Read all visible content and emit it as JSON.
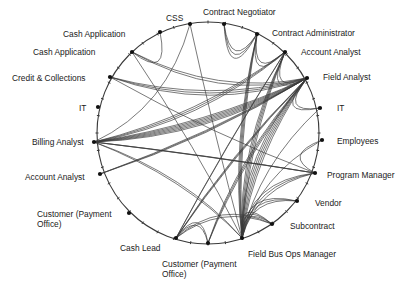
{
  "diagram": {
    "type": "chord-network",
    "colors": {
      "line": "#3a3a3a",
      "node": "#111111",
      "background": "#ffffff"
    },
    "circle": {
      "cx": 208,
      "cy": 133,
      "r": 111
    },
    "nodes": [
      {
        "id": "css",
        "label": "CSS",
        "x": 190,
        "y": 24,
        "lx": 166,
        "ly": 13
      },
      {
        "id": "contract-negotiator",
        "label": "Contract Negotiator",
        "x": 224,
        "y": 24,
        "lx": 203,
        "ly": 7
      },
      {
        "id": "contract-administrator",
        "label": "Contract Administrator",
        "x": 257,
        "y": 34,
        "lx": 272,
        "ly": 28
      },
      {
        "id": "account-analyst-right",
        "label": "Account Analyst",
        "x": 285,
        "y": 52,
        "lx": 301,
        "ly": 47
      },
      {
        "id": "field-analyst",
        "label": "Field Analyst",
        "x": 307,
        "y": 78,
        "lx": 323,
        "ly": 72
      },
      {
        "id": "it-right",
        "label": "IT",
        "x": 320,
        "y": 108,
        "lx": 337,
        "ly": 103
      },
      {
        "id": "employees",
        "label": "Employees",
        "x": 322,
        "y": 140,
        "lx": 337,
        "ly": 136
      },
      {
        "id": "program-manager",
        "label": "Program Manager",
        "x": 315,
        "y": 173,
        "lx": 327,
        "ly": 170
      },
      {
        "id": "vendor",
        "label": "Vendor",
        "x": 297,
        "y": 201,
        "lx": 315,
        "ly": 198
      },
      {
        "id": "subcontract",
        "label": "Subcontract",
        "x": 272,
        "y": 224,
        "lx": 290,
        "ly": 221
      },
      {
        "id": "field-bus-ops-manager",
        "label": "Field Bus Ops Manager",
        "x": 242,
        "y": 238,
        "lx": 248,
        "ly": 249
      },
      {
        "id": "customer-payment-office-bottom",
        "label": "Customer (Payment Office)",
        "x": 208,
        "y": 243,
        "lx": 162,
        "ly": 259,
        "wrap": true
      },
      {
        "id": "cash-lead",
        "label": "Cash Lead",
        "x": 176,
        "y": 238,
        "lx": 120,
        "ly": 243
      },
      {
        "id": "customer-payment-office-left",
        "label": "Customer (Payment Office)",
        "x": 129,
        "y": 213,
        "lx": 37,
        "ly": 209,
        "wrap": true
      },
      {
        "id": "account-analyst-left",
        "label": "Account Analyst",
        "x": 100,
        "y": 174,
        "lx": 25,
        "ly": 172
      },
      {
        "id": "billing-analyst",
        "label": "Billing Analyst",
        "x": 94,
        "y": 142,
        "lx": 32,
        "ly": 137
      },
      {
        "id": "it-left",
        "label": "IT",
        "x": 98,
        "y": 107,
        "lx": 79,
        "ly": 103
      },
      {
        "id": "credit-collections",
        "label": "Credit & Collections",
        "x": 110,
        "y": 77,
        "lx": 12,
        "ly": 73
      },
      {
        "id": "cash-application-2",
        "label": "Cash Application",
        "x": 132,
        "y": 52,
        "lx": 33,
        "ly": 47
      },
      {
        "id": "cash-application-1",
        "label": "Cash Application",
        "x": 160,
        "y": 32,
        "lx": 63,
        "ly": 29
      }
    ],
    "edges": [
      {
        "from": "billing-analyst",
        "to": "field-analyst",
        "count": 6
      },
      {
        "from": "billing-analyst",
        "to": "account-analyst-right",
        "count": 3
      },
      {
        "from": "billing-analyst",
        "to": "program-manager",
        "count": 3
      },
      {
        "from": "billing-analyst",
        "to": "field-bus-ops-manager",
        "count": 2
      },
      {
        "from": "billing-analyst",
        "to": "css",
        "count": 1
      },
      {
        "from": "account-analyst-left",
        "to": "field-analyst",
        "count": 3
      },
      {
        "from": "credit-collections",
        "to": "field-analyst",
        "count": 3
      },
      {
        "from": "credit-collections",
        "to": "program-manager",
        "count": 1
      },
      {
        "from": "cash-application-2",
        "to": "field-analyst",
        "count": 2
      },
      {
        "from": "cash-application-2",
        "to": "field-bus-ops-manager",
        "count": 1
      },
      {
        "from": "cash-application-1",
        "to": "cash-application-2",
        "count": 1
      },
      {
        "from": "css",
        "to": "field-bus-ops-manager",
        "count": 1
      },
      {
        "from": "contract-negotiator",
        "to": "contract-administrator",
        "count": 3
      },
      {
        "from": "contract-administrator",
        "to": "field-bus-ops-manager",
        "count": 4
      },
      {
        "from": "contract-administrator",
        "to": "account-analyst-right",
        "count": 2
      },
      {
        "from": "account-analyst-right",
        "to": "field-bus-ops-manager",
        "count": 4
      },
      {
        "from": "account-analyst-right",
        "to": "field-analyst",
        "count": 2
      },
      {
        "from": "field-analyst",
        "to": "field-bus-ops-manager",
        "count": 5
      },
      {
        "from": "field-analyst",
        "to": "cash-lead",
        "count": 3
      },
      {
        "from": "field-analyst",
        "to": "it-right",
        "count": 2
      },
      {
        "from": "it-right",
        "to": "field-bus-ops-manager",
        "count": 1
      },
      {
        "from": "employees",
        "to": "field-bus-ops-manager",
        "count": 1
      },
      {
        "from": "employees",
        "to": "program-manager",
        "count": 1
      },
      {
        "from": "program-manager",
        "to": "field-bus-ops-manager",
        "count": 3
      },
      {
        "from": "vendor",
        "to": "field-bus-ops-manager",
        "count": 3
      },
      {
        "from": "subcontract",
        "to": "field-bus-ops-manager",
        "count": 3
      },
      {
        "from": "subcontract",
        "to": "cash-lead",
        "count": 2
      },
      {
        "from": "customer-payment-office-bottom",
        "to": "field-analyst",
        "count": 3
      },
      {
        "from": "customer-payment-office-bottom",
        "to": "cash-lead",
        "count": 2
      },
      {
        "from": "cash-lead",
        "to": "account-analyst-right",
        "count": 2
      }
    ],
    "tick_count": 40
  }
}
